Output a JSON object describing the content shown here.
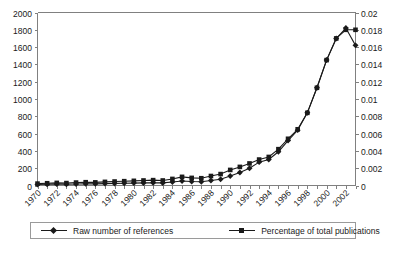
{
  "chart_data": {
    "type": "line",
    "title": "",
    "xlabel": "",
    "ylabel": "",
    "grid": false,
    "legend_position": "bottom",
    "x": [
      1970,
      1971,
      1972,
      1973,
      1974,
      1975,
      1976,
      1977,
      1978,
      1979,
      1980,
      1981,
      1982,
      1983,
      1984,
      1985,
      1986,
      1987,
      1988,
      1989,
      1990,
      1991,
      1992,
      1993,
      1994,
      1995,
      1996,
      1997,
      1998,
      1999,
      2000,
      2001,
      2002,
      2003
    ],
    "xtick_labels": [
      "1970",
      "1972",
      "1974",
      "1976",
      "1978",
      "1980",
      "1982",
      "1984",
      "1986",
      "1988",
      "1990",
      "1992",
      "1994",
      "1996",
      "1998",
      "2000",
      "2002"
    ],
    "xlim": [
      1970,
      2003
    ],
    "left_axis": {
      "ylim": [
        0,
        2000
      ],
      "ticks": [
        0,
        200,
        400,
        600,
        800,
        1000,
        1200,
        1400,
        1600,
        1800,
        2000
      ],
      "tick_labels": [
        "0",
        "200",
        "400",
        "600",
        "800",
        "1000",
        "1200",
        "1400",
        "1600",
        "1800",
        "2000"
      ]
    },
    "right_axis": {
      "ylim": [
        0,
        0.02
      ],
      "ticks": [
        0,
        0.002,
        0.004,
        0.006,
        0.008,
        0.01,
        0.012,
        0.014,
        0.016,
        0.018,
        0.02
      ],
      "tick_labels": [
        "0",
        "0.002",
        "0.004",
        "0.006",
        "0.008",
        "0.01",
        "0.012",
        "0.014",
        "0.016",
        "0.018",
        "0.02"
      ]
    },
    "series": [
      {
        "name": "Raw number of references",
        "axis": "left",
        "marker": "diamond",
        "color": "#1a1a1a",
        "values": [
          12,
          14,
          16,
          15,
          18,
          20,
          19,
          22,
          24,
          26,
          28,
          30,
          32,
          30,
          40,
          52,
          46,
          44,
          58,
          72,
          110,
          150,
          200,
          270,
          300,
          390,
          520,
          640,
          840,
          1130,
          1450,
          1700,
          1820,
          1620
        ]
      },
      {
        "name": "Percentage of total publications",
        "axis": "right",
        "marker": "square",
        "color": "#1a1a1a",
        "values": [
          0.00022,
          0.00026,
          0.0003,
          0.00028,
          0.00034,
          0.00038,
          0.00036,
          0.00042,
          0.00046,
          0.0005,
          0.00054,
          0.00058,
          0.00062,
          0.00058,
          0.00076,
          0.001,
          0.00088,
          0.00084,
          0.0011,
          0.00132,
          0.0018,
          0.00215,
          0.00255,
          0.003,
          0.0033,
          0.0042,
          0.0054,
          0.0065,
          0.0084,
          0.0113,
          0.0145,
          0.017,
          0.018,
          0.018
        ]
      }
    ]
  },
  "legend": {
    "entries": [
      {
        "label": "Raw number of references",
        "marker": "diamond"
      },
      {
        "label": "Percentage of total publications",
        "marker": "square"
      }
    ]
  },
  "caption": {
    "text": ""
  }
}
